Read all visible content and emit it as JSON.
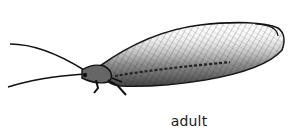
{
  "figure": {
    "caption": "adult",
    "colors": {
      "ink": "#111111",
      "background": "#ffffff"
    }
  }
}
